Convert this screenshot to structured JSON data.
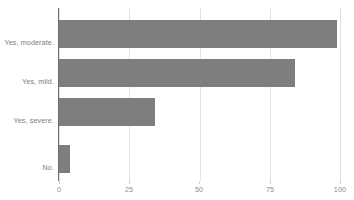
{
  "chart_data": {
    "type": "bar",
    "orientation": "horizontal",
    "title": "",
    "title_clipped": true,
    "xlabel": "",
    "ylabel": "",
    "categories": [
      "Yes, moderate.",
      "Yes, mild.",
      "Yes, severe.",
      "No."
    ],
    "values": [
      99,
      84,
      34,
      4
    ],
    "xlim": [
      0,
      100
    ],
    "xticks": [
      0,
      25,
      50,
      75,
      100
    ],
    "xtick_labels": [
      "0",
      "25",
      "50",
      "75",
      "100"
    ],
    "grid": true,
    "grid_axis": "x",
    "legend": false,
    "bar_color": "#7e7e7e",
    "gridline_color": "#e2e2e2",
    "axis_color": "#6f6f6f",
    "tick_label_color": "#8c8c8c",
    "category_label_color": "#7b7b7b",
    "background_color": "#ffffff"
  },
  "ticks": [
    {
      "label": "0",
      "value": 0
    },
    {
      "label": "25",
      "value": 25
    },
    {
      "label": "50",
      "value": 50
    },
    {
      "label": "75",
      "value": 75
    },
    {
      "label": "100",
      "value": 100
    }
  ],
  "bars": [
    {
      "label": "Yes, moderate.",
      "value": 99
    },
    {
      "label": "Yes, mild.",
      "value": 84
    },
    {
      "label": "Yes, severe.",
      "value": 34
    },
    {
      "label": "No.",
      "value": 4
    }
  ]
}
